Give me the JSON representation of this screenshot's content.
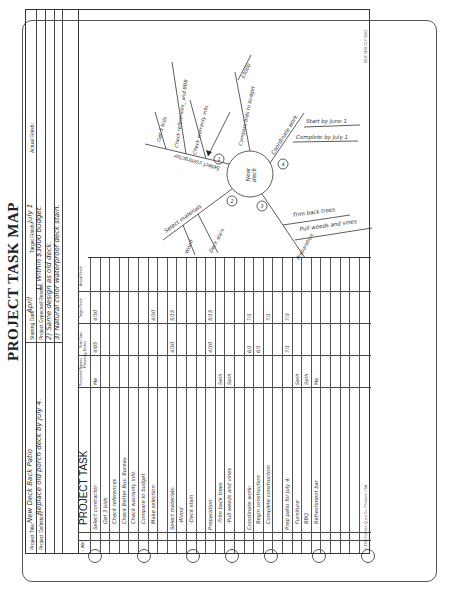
{
  "page": {
    "title": "PROJECT TASK MAP",
    "header": {
      "project_title_label": "Project Title:",
      "project_title": "New Deck Back Patio",
      "project_definition_label": "Project Definition:",
      "project_definition": "Replace old porch deck by July 4.",
      "starting_date_label": "Starting Date:",
      "starting_date": "April",
      "target_finish_label": "Target Finish:",
      "target_finish": "July 1",
      "actual_finish_label": "Actual Finish:",
      "actual_finish": "",
      "expected_results_label": "Project Expected Results:",
      "expected_results": [
        "1) Within $3000 budget.",
        "2) Same design as old deck.",
        "3) Natural color waterproof deck stain."
      ]
    },
    "table": {
      "check_header": "✓ ABC",
      "task_header": "PROJECT TASK",
      "columns": [
        "Personnel Names",
        "Start Date",
        "Target Finish",
        "Actual Finish"
      ],
      "rows": [
        {
          "task": "Select contractor:",
          "indent": 0,
          "person": "Me",
          "start": "4/05",
          "target": "4/30",
          "actual": ""
        },
        {
          "task": "Get 3 bids",
          "indent": 1,
          "person": "",
          "start": "",
          "target": "",
          "actual": ""
        },
        {
          "task": "Check references",
          "indent": 1,
          "person": "",
          "start": "",
          "target": "",
          "actual": ""
        },
        {
          "task": "Check Better Bus. Bureau",
          "indent": 1,
          "person": "",
          "start": "",
          "target": "",
          "actual": ""
        },
        {
          "task": "Check warranty info.",
          "indent": 1,
          "person": "",
          "start": "",
          "target": "",
          "actual": ""
        },
        {
          "task": "Compare to budget",
          "indent": 1,
          "person": "",
          "start": "",
          "target": "",
          "actual": ""
        },
        {
          "task": "Make selection",
          "indent": 1,
          "person": "",
          "start": "",
          "target": "4/30",
          "actual": ""
        },
        {
          "task": "",
          "indent": 0,
          "person": "",
          "start": "",
          "target": "",
          "actual": ""
        },
        {
          "task": "Select materials:",
          "indent": 0,
          "person": "",
          "start": "4/30",
          "target": "5/15",
          "actual": ""
        },
        {
          "task": "-Wood",
          "indent": 1,
          "person": "",
          "start": "",
          "target": "",
          "actual": ""
        },
        {
          "task": "-Deck stain",
          "indent": 1,
          "person": "",
          "start": "",
          "target": "",
          "actual": ""
        },
        {
          "task": "",
          "indent": 0,
          "person": "",
          "start": "",
          "target": "",
          "actual": ""
        },
        {
          "task": "Preparation:",
          "indent": 0,
          "person": "",
          "start": "4/30",
          "target": "5/15",
          "actual": ""
        },
        {
          "task": "-Trim back trees",
          "indent": 1,
          "person": "Seth",
          "start": "",
          "target": "",
          "actual": ""
        },
        {
          "task": "-Pull weeds and vines",
          "indent": 1,
          "person": "Seth",
          "start": "",
          "target": "",
          "actual": ""
        },
        {
          "task": "",
          "indent": 0,
          "person": "",
          "start": "",
          "target": "",
          "actual": ""
        },
        {
          "task": "Coordinate work:",
          "indent": 0,
          "person": "",
          "start": "6/1",
          "target": "7/1",
          "actual": ""
        },
        {
          "task": "Begin construction",
          "indent": 1,
          "person": "",
          "start": "6/1",
          "target": "",
          "actual": ""
        },
        {
          "task": "Complete construction",
          "indent": 1,
          "person": "",
          "start": "",
          "target": "7/1",
          "actual": ""
        },
        {
          "task": "",
          "indent": 0,
          "person": "",
          "start": "",
          "target": "",
          "actual": ""
        },
        {
          "task": "Prep patio for July 4:",
          "indent": 0,
          "person": "",
          "start": "7/1",
          "target": "7/3",
          "actual": ""
        },
        {
          "task": "Furniture",
          "indent": 1,
          "person": "Seth",
          "start": "",
          "target": "",
          "actual": ""
        },
        {
          "task": "BBQ",
          "indent": 1,
          "person": "Seth",
          "start": "",
          "target": "",
          "actual": ""
        },
        {
          "task": "Refreshment bar",
          "indent": 1,
          "person": "Me",
          "start": "",
          "target": "",
          "actual": ""
        }
      ]
    },
    "planning_notes_label": "Planning Notes",
    "mind_map": {
      "center": "New deck",
      "branches": [
        {
          "number": "1",
          "label": "Select contractor",
          "subs": [
            "Get 3 bids",
            "Check references_ and BBB",
            "Check warranty info."
          ]
        },
        {
          "number": "2",
          "label": "Select materials",
          "subs": [
            "Wood",
            "Deck stain"
          ]
        },
        {
          "number": "3",
          "label": "Preparation",
          "subs": [
            "Trim back trees",
            "Pull weeds and vines"
          ]
        },
        {
          "number": "4",
          "label": "Coordinate work",
          "subs": [
            "Start by June 1",
            "Complete by July 1"
          ]
        }
      ],
      "callout": [
        "Compare bids to budget",
        "$3000"
      ]
    },
    "footer_left": "© 1992 Franklin Quest Co.   Printed in USA",
    "footer_right": "MOF 2193  CLF 4193"
  }
}
